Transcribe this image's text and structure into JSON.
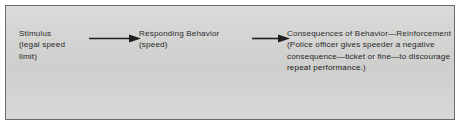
{
  "diagram": {
    "background_color": "#d6d6d4",
    "border_color": "#6b6b6b",
    "text_color": "#1b1b1b",
    "stages": [
      {
        "id": "stimulus",
        "label": "Stimulus",
        "detail": "(legal speed limit)",
        "text": "Stimulus\n(legal speed limit)"
      },
      {
        "id": "responding-behavior",
        "label": "Responding Behavior",
        "detail": "(speed)",
        "text": "Responding Behavior\n(speed)"
      },
      {
        "id": "consequences",
        "label": "Consequences of Behavior—",
        "detail": "Reinforcement (Police officer gives speeder a negative consequence—ticket or fine—to discourage repeat performance.)",
        "text": "Consequences of Behavior—Reinforcement (Police officer gives speeder a negative consequence—ticket or fine—to discourage repeat performance.)"
      }
    ],
    "arrows": [
      {
        "id": "arrow-one",
        "from": "stimulus",
        "to": "responding-behavior",
        "direction": "right",
        "color": "#151515"
      },
      {
        "id": "arrow-two",
        "from": "responding-behavior",
        "to": "consequences",
        "direction": "right",
        "color": "#151515"
      }
    ]
  }
}
